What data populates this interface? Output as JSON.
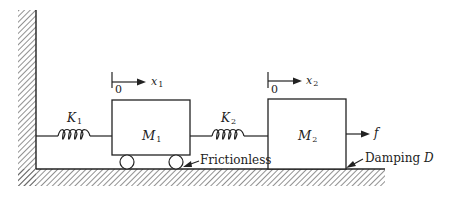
{
  "diagram": {
    "masses": [
      {
        "id": "M1",
        "label": "M",
        "sub": "1",
        "support": "wheels"
      },
      {
        "id": "M2",
        "label": "M",
        "sub": "2",
        "support": "sliding"
      }
    ],
    "springs": [
      {
        "id": "K1",
        "label": "K",
        "sub": "1"
      },
      {
        "id": "K2",
        "label": "K",
        "sub": "2"
      }
    ],
    "displacements": [
      {
        "id": "x1",
        "label": "x",
        "sub": "1",
        "origin": "0"
      },
      {
        "id": "x2",
        "label": "x",
        "sub": "2",
        "origin": "0"
      }
    ],
    "force": {
      "label": "f"
    },
    "annotations": {
      "frictionless": "Frictionless",
      "damping_prefix": "Damping ",
      "damping_symbol": "D"
    },
    "colors": {
      "line": "#222222",
      "hatch": "#555555",
      "background": "#ffffff"
    }
  }
}
